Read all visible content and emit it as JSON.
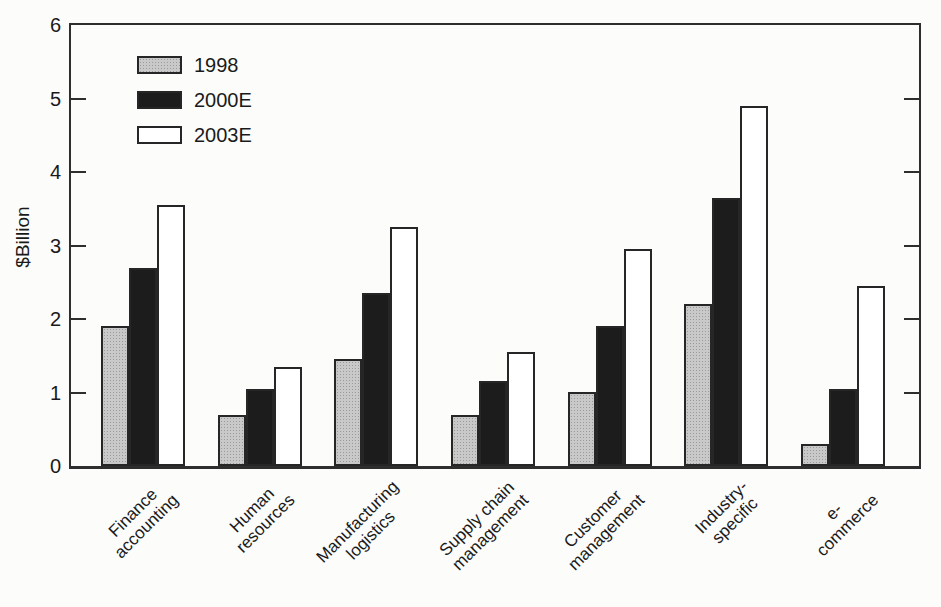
{
  "chart_data": {
    "type": "bar",
    "title": "",
    "xlabel": "",
    "ylabel": "$Billion",
    "ylim": [
      0,
      6
    ],
    "yticks": [
      "0",
      "1",
      "2",
      "3",
      "4",
      "5",
      "6"
    ],
    "grid": false,
    "legend_position": "top-left-inside",
    "categories": [
      "Finance\naccounting",
      "Human\nresources",
      "Manufacturing\nlogistics",
      "Supply chain\nmanagement",
      "Customer\nmanagement",
      "Industry-specific",
      "e-commerce"
    ],
    "series": [
      {
        "name": "1998",
        "color": "#c9c9c9",
        "texture": "halftone-dots",
        "values": [
          1.9,
          0.7,
          1.45,
          0.7,
          1.0,
          2.2,
          0.3
        ]
      },
      {
        "name": "2000E",
        "color": "#1c1c1c",
        "texture": "solid",
        "values": [
          2.7,
          1.05,
          2.35,
          1.15,
          1.9,
          3.65,
          1.05
        ]
      },
      {
        "name": "2003E",
        "color": "#ffffff",
        "texture": "solid",
        "values": [
          3.55,
          1.35,
          3.25,
          1.55,
          2.95,
          4.9,
          2.45
        ]
      }
    ]
  },
  "colors": {
    "frame": "#2e2e2e",
    "text": "#1a1a1a",
    "background": "#fcfcfb",
    "bar_outline": "#262626"
  }
}
